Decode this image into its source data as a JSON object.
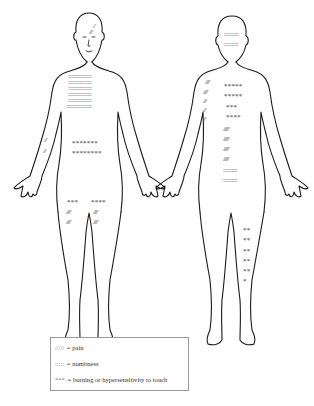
{
  "diagram": {
    "views": [
      {
        "name": "front",
        "regions": [
          {
            "area": "forehead-right",
            "symptom": "pain",
            "pattern": "////"
          },
          {
            "area": "chest",
            "symptom": "numbness",
            "rows": 5
          },
          {
            "area": "abdomen",
            "symptom": "burning or hypersensitivity to touch",
            "rows": [
              "*******",
              "********"
            ]
          },
          {
            "area": "right-forearm",
            "symptom": "pain",
            "rows": [
              "///",
              "///"
            ]
          },
          {
            "area": "right-thigh",
            "symptom": "burning or hypersensitivity to touch",
            "pattern": "***"
          },
          {
            "area": "left-thigh",
            "symptom": "burning or hypersensitivity to touch",
            "pattern": "****"
          },
          {
            "area": "right-thigh",
            "symptom": "pain",
            "rows": [
              "//////",
              "//////"
            ]
          },
          {
            "area": "left-thigh",
            "symptom": "pain",
            "rows": [
              "//////",
              "//////"
            ]
          }
        ]
      },
      {
        "name": "back",
        "regions": [
          {
            "area": "back-of-head",
            "symptom": "numbness",
            "rows": 2
          },
          {
            "area": "left-shoulder-back",
            "symptom": "pain",
            "rows": [
              "//////",
              "//////",
              "////",
              "///",
              "///"
            ]
          },
          {
            "area": "upper-back",
            "symptom": "burning or hypersensitivity to touch",
            "rows": [
              "*****",
              "*****",
              "***",
              "****"
            ]
          },
          {
            "area": "lower-back",
            "symptom": "pain",
            "rows": [
              "////////",
              "////////",
              "////////",
              "////////"
            ]
          },
          {
            "area": "lower-back",
            "symptom": "numbness",
            "rows": 2
          },
          {
            "area": "right-calf-back",
            "symptom": "burning or hypersensitivity to touch",
            "rows": [
              "**",
              "**",
              "**",
              "**",
              "**",
              "*"
            ]
          }
        ]
      }
    ]
  },
  "legend": {
    "items": [
      {
        "symbol": "///// ",
        "label": "= pain"
      },
      {
        "symbol": "::::: ",
        "label": "= numbness"
      },
      {
        "symbol": "*** ",
        "label": "= burning or hypersensitivity to touch"
      }
    ]
  }
}
